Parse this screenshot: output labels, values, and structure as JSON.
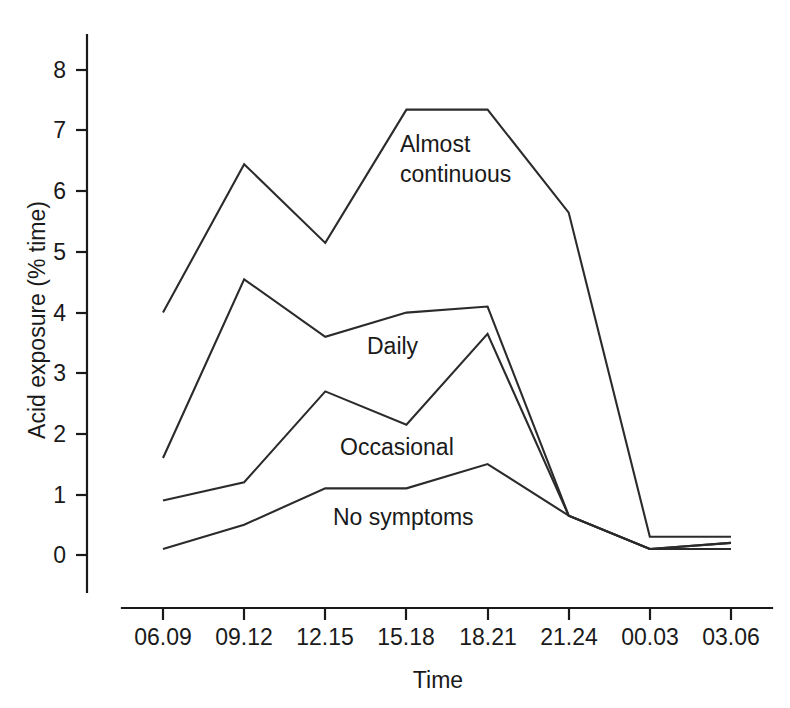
{
  "chart_data": {
    "type": "line",
    "title": "",
    "xlabel": "Time",
    "ylabel": "Acid exposure (% time)",
    "categories": [
      "06.09",
      "09.12",
      "12.15",
      "15.18",
      "18.21",
      "21.24",
      "00.03",
      "03.06"
    ],
    "ylim": [
      0,
      8.6
    ],
    "yticks": [
      0,
      1,
      2,
      3,
      4,
      5,
      6,
      7,
      8
    ],
    "ytick_labels": [
      "0",
      "1",
      "2",
      "3",
      "4",
      "5",
      "6",
      "7",
      "8"
    ],
    "grid": false,
    "legend": "inline-labels",
    "series": [
      {
        "name": "Almost continuous",
        "label": "Almost continuous",
        "label_line1": "Almost",
        "label_line2": "continuous",
        "values": [
          4.0,
          6.45,
          5.15,
          7.35,
          7.35,
          5.65,
          0.3,
          0.3
        ]
      },
      {
        "name": "Daily",
        "label": "Daily",
        "values": [
          1.6,
          4.55,
          3.6,
          4.0,
          4.1,
          0.65,
          0.1,
          0.2
        ]
      },
      {
        "name": "Occasional",
        "label": "Occasional",
        "values": [
          0.9,
          1.2,
          2.7,
          2.15,
          3.65,
          0.65,
          0.1,
          0.2
        ]
      },
      {
        "name": "No symptoms",
        "label": "No symptoms",
        "values": [
          0.1,
          0.5,
          1.1,
          1.1,
          1.5,
          0.65,
          0.1,
          0.1
        ]
      }
    ],
    "colors": {
      "line": "#2b2b2b",
      "axis": "#1a1a1a",
      "background": "#ffffff"
    }
  }
}
